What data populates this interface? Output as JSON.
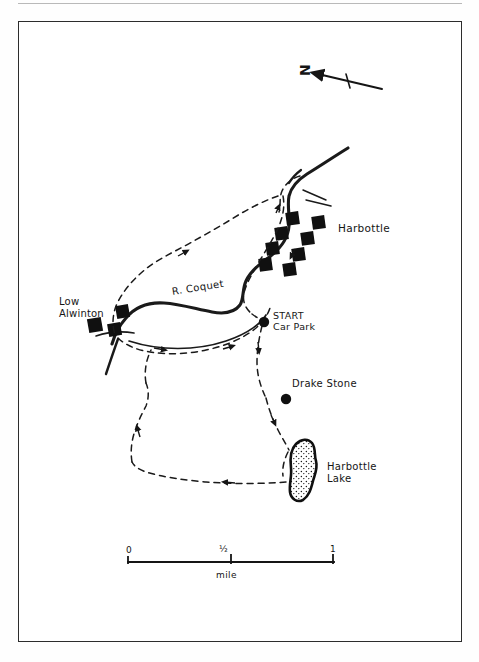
{
  "map": {
    "title": "Harbottle and Drake Stone walk map",
    "type": "hand-drawn-walking-route-map",
    "frame": {
      "border_color": "#2c2c2c",
      "background": "#ffffff"
    },
    "ink_color": "#151515"
  },
  "compass": {
    "label": "N",
    "icon": "north-arrow-icon",
    "direction": "up-left"
  },
  "places": [
    {
      "name": "Harbottle",
      "label": "Harbottle",
      "kind": "village"
    },
    {
      "name": "Low Alwinton",
      "label": "Low\nAlwinton",
      "kind": "hamlet"
    },
    {
      "name": "Harbottle Lake",
      "label": "Harbottle\nLake",
      "kind": "lake"
    }
  ],
  "points": [
    {
      "name": "start-car-park",
      "label": "START\nCar Park",
      "marker": "filled-dot"
    },
    {
      "name": "drake-stone",
      "label": "Drake Stone",
      "marker": "filled-dot"
    }
  ],
  "river": {
    "name": "R. Coquet",
    "label": "R. Coquet",
    "style": "thick-solid-line"
  },
  "route": {
    "style": "dashed-line-with-direction-arrows",
    "type": "circular-walk"
  },
  "scale": {
    "ticks": [
      "0",
      "½",
      "1"
    ],
    "unit": "mile",
    "zero": "0",
    "half": "½",
    "one": "1"
  }
}
